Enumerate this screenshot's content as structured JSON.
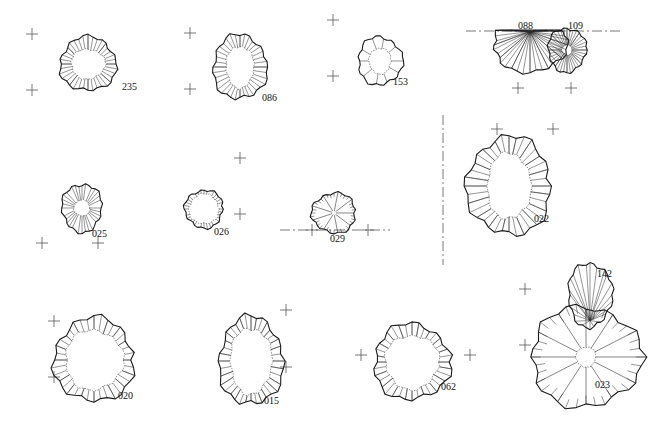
{
  "features": [
    {
      "id": "235",
      "cx": 88,
      "cy": 64,
      "rx": 28,
      "ry": 27,
      "irx": 17,
      "iry": 15,
      "style": "ring",
      "label_x": 122,
      "label_y": 90,
      "ticks": 44
    },
    {
      "id": "086",
      "cx": 240,
      "cy": 67,
      "rx": 27,
      "ry": 32,
      "irx": 14,
      "iry": 21,
      "style": "ring",
      "label_x": 262,
      "label_y": 101,
      "ticks": 40
    },
    {
      "id": "153",
      "cx": 380,
      "cy": 61,
      "rx": 22,
      "ry": 24,
      "irx": 11,
      "iry": 13,
      "style": "sparse",
      "label_x": 393,
      "label_y": 85,
      "ticks": 10
    },
    {
      "id": "088",
      "cx": 530,
      "cy": 45,
      "rx": 37,
      "ry": 27,
      "irx": 0,
      "iry": 0,
      "style": "half",
      "label_x": 518,
      "label_y": 29,
      "ticks": 48
    },
    {
      "id": "109",
      "cx": 567,
      "cy": 50,
      "rx": 19,
      "ry": 22,
      "irx": 5,
      "iry": 5,
      "style": "radial",
      "label_x": 568,
      "label_y": 29,
      "ticks": 44
    },
    {
      "id": "025",
      "cx": 82,
      "cy": 208,
      "rx": 20,
      "ry": 24,
      "irx": 8,
      "iry": 8,
      "style": "radial",
      "label_x": 92,
      "label_y": 237,
      "ticks": 30
    },
    {
      "id": "026",
      "cx": 204,
      "cy": 209,
      "rx": 19,
      "ry": 19,
      "irx": 15,
      "iry": 15,
      "style": "ring",
      "label_x": 214,
      "label_y": 235,
      "ticks": 30
    },
    {
      "id": "029",
      "cx": 334,
      "cy": 213,
      "rx": 22,
      "ry": 20,
      "irx": 0,
      "iry": 0,
      "style": "spokes",
      "label_x": 330,
      "label_y": 242,
      "ticks": 36
    },
    {
      "id": "022",
      "cx": 509,
      "cy": 186,
      "rx": 42,
      "ry": 49,
      "irx": 22,
      "iry": 33,
      "style": "ring",
      "label_x": 534,
      "label_y": 222,
      "ticks": 56
    },
    {
      "id": "020",
      "cx": 94,
      "cy": 360,
      "rx": 40,
      "ry": 42,
      "irx": 29,
      "iry": 30,
      "style": "ring",
      "label_x": 118,
      "label_y": 399,
      "ticks": 52
    },
    {
      "id": "015",
      "cx": 251,
      "cy": 361,
      "rx": 32,
      "ry": 44,
      "irx": 21,
      "iry": 33,
      "style": "ring",
      "label_x": 264,
      "label_y": 404,
      "ticks": 60
    },
    {
      "id": "062",
      "cx": 412,
      "cy": 362,
      "rx": 38,
      "ry": 38,
      "irx": 27,
      "iry": 27,
      "style": "ring",
      "label_x": 441,
      "label_y": 390,
      "ticks": 56
    },
    {
      "id": "023",
      "cx": 586,
      "cy": 357,
      "rx": 55,
      "ry": 50,
      "irx": 10,
      "iry": 10,
      "style": "spokes",
      "label_x": 595,
      "label_y": 388,
      "ticks": 48
    },
    {
      "id": "142",
      "cx": 590,
      "cy": 295,
      "rx": 22,
      "ry": 32,
      "irx": 0,
      "iry": 0,
      "style": "lobe",
      "label_x": 597,
      "label_y": 277,
      "ticks": 22
    }
  ],
  "crosshairs": [
    [
      32,
      34
    ],
    [
      32,
      90
    ],
    [
      190,
      33
    ],
    [
      190,
      89
    ],
    [
      333,
      20
    ],
    [
      333,
      76
    ],
    [
      518,
      88
    ],
    [
      571,
      88
    ],
    [
      42,
      243
    ],
    [
      98,
      243
    ],
    [
      240,
      158
    ],
    [
      240,
      214
    ],
    [
      312,
      230
    ],
    [
      368,
      230
    ],
    [
      497,
      129
    ],
    [
      553,
      129
    ],
    [
      54,
      321
    ],
    [
      54,
      377
    ],
    [
      286,
      310
    ],
    [
      286,
      367
    ],
    [
      361,
      355
    ],
    [
      470,
      355
    ],
    [
      525,
      289
    ],
    [
      525,
      345
    ]
  ],
  "dash_lines": [
    {
      "x1": 466,
      "y1": 31,
      "x2": 622,
      "y2": 31
    },
    {
      "x1": 280,
      "y1": 230,
      "x2": 390,
      "y2": 230
    },
    {
      "x1": 443,
      "y1": 115,
      "x2": 443,
      "y2": 265
    }
  ],
  "colors": {
    "ink": "#1a1a1a",
    "background": "#ffffff"
  }
}
